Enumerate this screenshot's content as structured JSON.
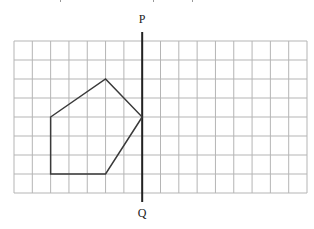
{
  "diagram": {
    "type": "geometry-grid-reflection",
    "colors": {
      "background": "#ffffff",
      "grid_line": "#b5b5b5",
      "polygon_stroke": "#3a3a3a",
      "mirror_line": "#222222",
      "label": "#222222"
    },
    "grid": {
      "columns": 16,
      "rows": 8,
      "left": 14,
      "top": 41,
      "right": 307,
      "bottom": 193
    },
    "mirror_line": {
      "name": "PQ",
      "x_col": 7,
      "y_top": 32,
      "y_bottom": 202,
      "top_label": "P",
      "bottom_label": "Q"
    },
    "shape": {
      "name": "pentagon",
      "vertices_grid": [
        [
          2,
          4
        ],
        [
          5,
          2
        ],
        [
          7,
          4
        ],
        [
          5,
          7
        ],
        [
          2,
          7
        ]
      ]
    }
  }
}
